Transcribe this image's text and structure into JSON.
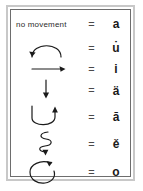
{
  "figure": {
    "title_text": "no movement",
    "equals_symbol": "=",
    "rows": [
      {
        "symbol_name": "no-movement-text",
        "symbol_label": "no movement",
        "equals": "=",
        "letter": "a",
        "letter_name": "letter-a"
      },
      {
        "symbol_name": "arc-counterclockwise-arrow",
        "symbol_label": "arc over, arrowhead at left",
        "equals": "=",
        "letter": "u̇",
        "letter_name": "letter-u-dot-above"
      },
      {
        "symbol_name": "right-arrow",
        "symbol_label": "straight arrow pointing right",
        "equals": "=",
        "letter": "i",
        "letter_name": "letter-i"
      },
      {
        "symbol_name": "down-arrow",
        "symbol_label": "straight arrow pointing down",
        "equals": "=",
        "letter": "ä",
        "letter_name": "letter-a-diaeresis"
      },
      {
        "symbol_name": "u-turn-up-arrow",
        "symbol_label": "U-shaped curve, arrowhead up at right",
        "equals": "=",
        "letter": "ā",
        "letter_name": "letter-a-macron"
      },
      {
        "symbol_name": "wavy-down-arrow",
        "symbol_label": "vertical wavy line, arrowhead down",
        "equals": "=",
        "letter": "ě",
        "letter_name": "letter-e-caron"
      },
      {
        "symbol_name": "loop-circle-arrow",
        "symbol_label": "near-full circle loop, arrowhead at top",
        "equals": "=",
        "letter": "o",
        "letter_name": "letter-o"
      }
    ],
    "colors": {
      "stroke": "#1a1a1a",
      "frame": "#6d6d6d",
      "outer_frame": "#c8c8c8",
      "text": "#2b2b2b",
      "equals": "#4a4a4a",
      "background": "#ffffff"
    }
  }
}
